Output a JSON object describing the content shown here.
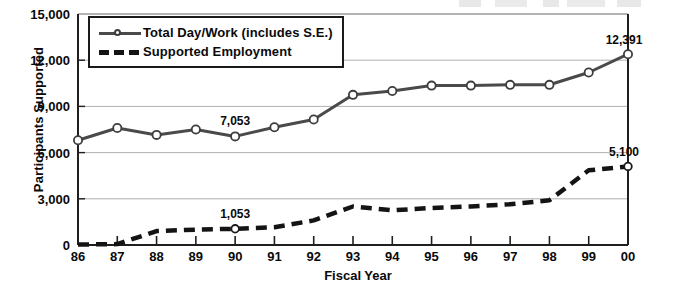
{
  "chart_data": {
    "type": "line",
    "title": "",
    "xlabel": "Fiscal Year",
    "ylabel": "Participants Supported",
    "categories": [
      "86",
      "87",
      "88",
      "89",
      "90",
      "91",
      "92",
      "93",
      "94",
      "95",
      "96",
      "97",
      "98",
      "99",
      "00"
    ],
    "ylim": [
      0,
      15000
    ],
    "yticks": [
      "0",
      "3,000",
      "6,000",
      "9,000",
      "12,000",
      "15,000"
    ],
    "ytick_values": [
      0,
      3000,
      6000,
      9000,
      12000,
      15000
    ],
    "grid": "horizontal",
    "legend_position": "top-left inside plot",
    "series": [
      {
        "name": "Total Day/Work (includes S.E.)",
        "style": "solid-with-circle-markers",
        "color": "#4a4a4a",
        "values": [
          6800,
          7600,
          7150,
          7500,
          7053,
          7650,
          8150,
          9750,
          10000,
          10350,
          10350,
          10400,
          10400,
          11200,
          12391
        ]
      },
      {
        "name": "Supported Employment",
        "style": "dashed",
        "color": "#141414",
        "values": [
          30,
          60,
          900,
          1000,
          1053,
          1150,
          1600,
          2500,
          2250,
          2400,
          2500,
          2650,
          2900,
          4850,
          5100
        ]
      }
    ],
    "annotations": [
      {
        "label": "7,053",
        "series": "Total Day/Work (includes S.E.)",
        "category": "90",
        "value": 7053
      },
      {
        "label": "12,391",
        "series": "Total Day/Work (includes S.E.)",
        "category": "00",
        "value": 12391
      },
      {
        "label": "1,053",
        "series": "Supported Employment",
        "category": "90",
        "value": 1053
      },
      {
        "label": "5,100",
        "series": "Supported Employment",
        "category": "00",
        "value": 5100
      }
    ]
  },
  "legend": {
    "items": [
      {
        "label": "Total Day/Work (includes S.E.)"
      },
      {
        "label": "Supported Employment"
      }
    ]
  }
}
